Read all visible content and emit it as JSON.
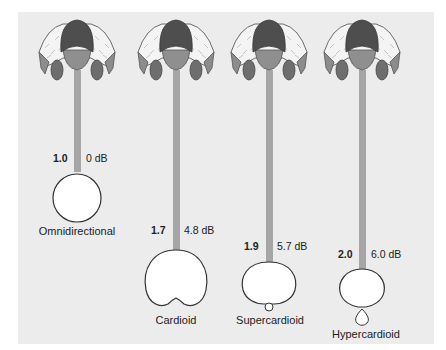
{
  "figure": {
    "background_color": "#ececec",
    "bar_color": "#a6a6a6",
    "patterns": [
      {
        "name": "Omnidirectional",
        "distance_factor": "1.0",
        "gain": "0 dB"
      },
      {
        "name": "Cardioid",
        "distance_factor": "1.7",
        "gain": "4.8 dB"
      },
      {
        "name": "Supercardioid",
        "distance_factor": "1.9",
        "gain": "5.7 dB"
      },
      {
        "name": "Hypercardioid",
        "distance_factor": "2.0",
        "gain": "6.0 dB"
      }
    ]
  }
}
